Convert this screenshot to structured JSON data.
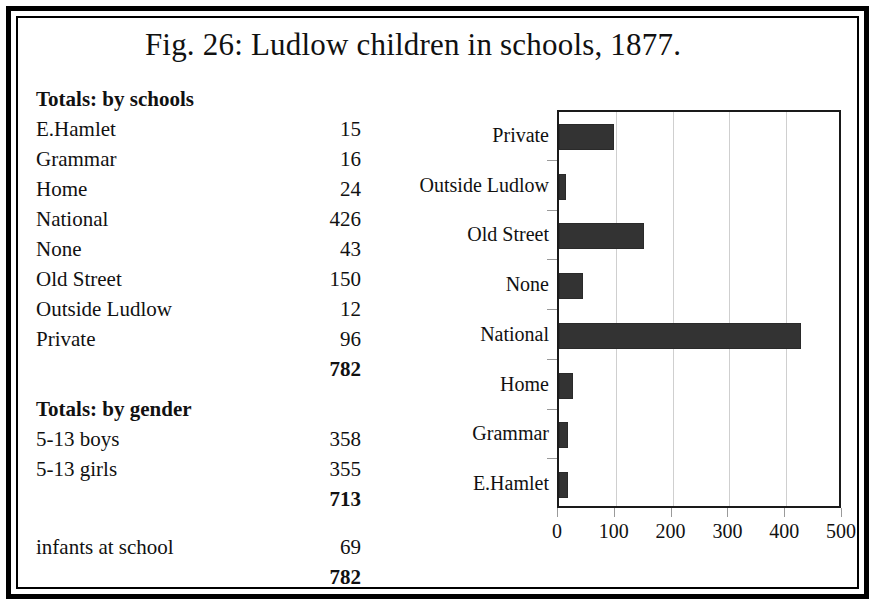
{
  "figure": {
    "title": "Fig. 26: Ludlow children in schools, 1877."
  },
  "schools_table": {
    "heading": "Totals: by schools",
    "rows": [
      {
        "label": "E.Hamlet",
        "value": "15"
      },
      {
        "label": "Grammar",
        "value": "16"
      },
      {
        "label": "Home",
        "value": "24"
      },
      {
        "label": "National",
        "value": "426"
      },
      {
        "label": "None",
        "value": "43"
      },
      {
        "label": "Old Street",
        "value": "150"
      },
      {
        "label": "Outside Ludlow",
        "value": "12"
      },
      {
        "label": "Private",
        "value": "96"
      }
    ],
    "total": {
      "label": "",
      "value": "782"
    }
  },
  "gender_table": {
    "heading": "Totals: by gender",
    "rows": [
      {
        "label": "5-13 boys",
        "value": "358"
      },
      {
        "label": "5-13 girls",
        "value": "355"
      }
    ],
    "subtotal": {
      "label": "",
      "value": "713"
    },
    "extra": {
      "label": "infants at school",
      "value": "69"
    },
    "total": {
      "label": "",
      "value": "782"
    }
  },
  "chart_data": {
    "type": "bar",
    "orientation": "horizontal",
    "title": "",
    "xlabel": "",
    "ylabel": "",
    "xlim": [
      0,
      500
    ],
    "xticks": [
      0,
      100,
      200,
      300,
      400,
      500
    ],
    "xtick_labels": [
      "0",
      "100",
      "200",
      "300",
      "400",
      "500"
    ],
    "grid": true,
    "grid_axis": "x",
    "legend": false,
    "bar_color": "#333333",
    "categories": [
      "E.Hamlet",
      "Grammar",
      "Home",
      "National",
      "None",
      "Old Street",
      "Outside Ludlow",
      "Private"
    ],
    "values": [
      15,
      16,
      24,
      426,
      43,
      150,
      12,
      96
    ],
    "display_order_top_to_bottom": [
      "Private",
      "Outside Ludlow",
      "Old Street",
      "None",
      "National",
      "Home",
      "Grammar",
      "E.Hamlet"
    ],
    "display_values_top_to_bottom": [
      96,
      12,
      150,
      43,
      426,
      24,
      16,
      15
    ]
  }
}
